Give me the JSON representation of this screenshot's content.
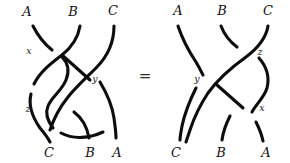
{
  "figure": {
    "kind": "braid-relation-diagram",
    "relation_symbol": "=",
    "stroke_color": "#0d0d0d",
    "background_color": "#ffffff",
    "label_color": "#111111"
  },
  "left_braid": {
    "name": "left-braid",
    "top_labels": [
      "A",
      "B",
      "C"
    ],
    "bottom_labels": [
      "C",
      "B",
      "A"
    ],
    "crossing_labels": [
      "x",
      "z",
      "y"
    ],
    "crossings": [
      {
        "id": "x",
        "label": "x",
        "position": "upper-left"
      },
      {
        "id": "z",
        "label": "z",
        "position": "lower-left"
      },
      {
        "id": "y",
        "label": "y",
        "position": "middle-right"
      }
    ]
  },
  "right_braid": {
    "name": "right-braid",
    "top_labels": [
      "A",
      "B",
      "C"
    ],
    "bottom_labels": [
      "C",
      "B",
      "A"
    ],
    "crossing_labels": [
      "z",
      "y",
      "x"
    ],
    "crossings": [
      {
        "id": "z",
        "label": "z",
        "position": "upper-right"
      },
      {
        "id": "y",
        "label": "y",
        "position": "middle-left"
      },
      {
        "id": "x",
        "label": "x",
        "position": "lower-right"
      }
    ]
  }
}
